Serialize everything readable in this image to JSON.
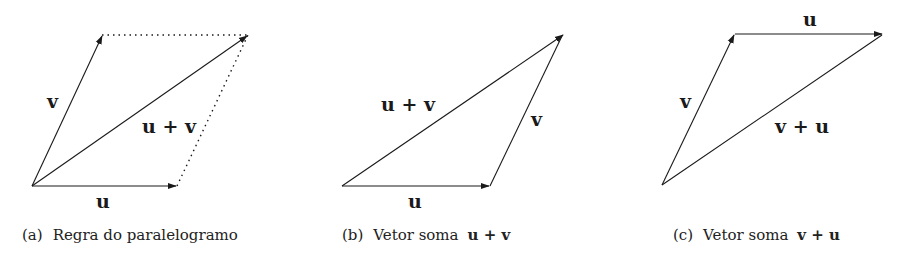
{
  "panels": [
    {
      "id": "a",
      "caption_tag": "(a)",
      "caption_text": "Regra do paralelogramo",
      "caption_math": "",
      "labels": {
        "u": "u",
        "v": "v",
        "sum": "u + v"
      }
    },
    {
      "id": "b",
      "caption_tag": "(b)",
      "caption_text": "Vetor soma",
      "caption_math": "u + v",
      "labels": {
        "u": "u",
        "v": "v",
        "sum": "u + v"
      }
    },
    {
      "id": "c",
      "caption_tag": "(c)",
      "caption_text": "Vetor soma",
      "caption_math": "v + u",
      "labels": {
        "u": "u",
        "v": "v",
        "sum": "v + u"
      }
    }
  ]
}
